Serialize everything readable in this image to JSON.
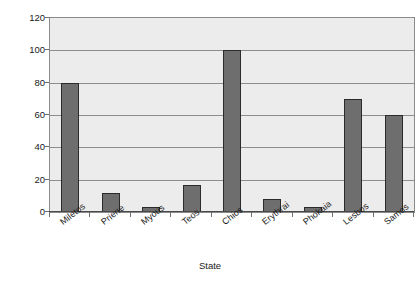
{
  "chart_data": {
    "type": "bar",
    "title": "",
    "subtitle": "",
    "xlabel": "State",
    "ylabel": "Number of ships",
    "categories": [
      "Miletos",
      "Priene",
      "Myous",
      "Teos",
      "Chios",
      "Erythrai",
      "Phokaia",
      "Lesbos",
      "Samos"
    ],
    "values": [
      80,
      12,
      3,
      17,
      100,
      8,
      3,
      70,
      60
    ],
    "series": [
      {
        "name": "Number of ships",
        "values": [
          80,
          12,
          3,
          17,
          100,
          8,
          3,
          70,
          60
        ]
      }
    ],
    "ylim": [
      0,
      120
    ],
    "yticks": [
      0,
      20,
      40,
      60,
      80,
      100,
      120
    ],
    "ytick_labels": [
      "0",
      "20",
      "40",
      "60",
      "80",
      "100",
      "120"
    ],
    "grid": true,
    "legend": false,
    "legend_position": "none",
    "annotations": [],
    "colors": {
      "bar_fill": "#6e6e6e",
      "bar_edge": "#2b2b2b",
      "plot_background": "#ececec",
      "gridline": "#8d8d8d",
      "axis": "#4a4a4a",
      "text": "#1a1a1a",
      "figure_background": "#ffffff"
    }
  }
}
